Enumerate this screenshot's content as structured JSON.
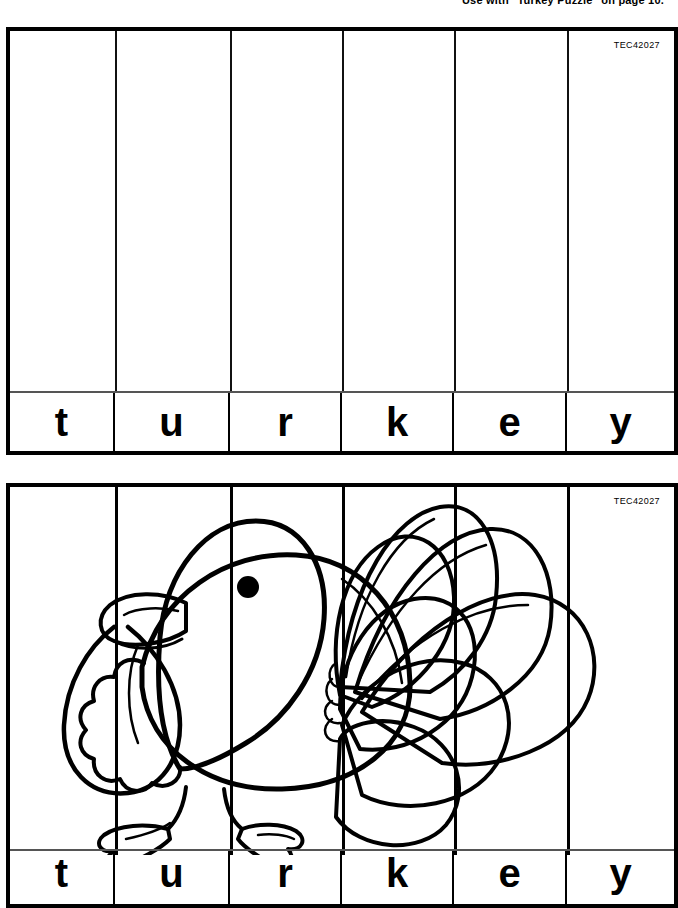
{
  "page": {
    "header_note": "Use with \"Turkey Puzzle\" on page 10.",
    "background_color": "#ffffff",
    "ink_color": "#000000"
  },
  "word": {
    "text": "turkey",
    "letters": [
      "t",
      "u",
      "r",
      "k",
      "e",
      "y"
    ]
  },
  "puzzles": [
    {
      "id": "blank",
      "kind": "blank-grid",
      "tec_code": "TEC42027",
      "letters": [
        "t",
        "u",
        "r",
        "k",
        "e",
        "y"
      ],
      "column_count": 6
    },
    {
      "id": "picture",
      "kind": "turkey-picture",
      "tec_code": "TEC42027",
      "letters": [
        "t",
        "u",
        "r",
        "k",
        "e",
        "y"
      ],
      "column_count": 6,
      "artwork": "turkey-line-art"
    }
  ],
  "artwork": {
    "name": "turkey-line-art",
    "description": "Black outline drawing of a turkey facing left with a fanned tail",
    "parts": [
      "head",
      "eye",
      "beak",
      "wattle",
      "neck-ruff",
      "body",
      "tail-fan",
      "legs",
      "feet"
    ]
  }
}
